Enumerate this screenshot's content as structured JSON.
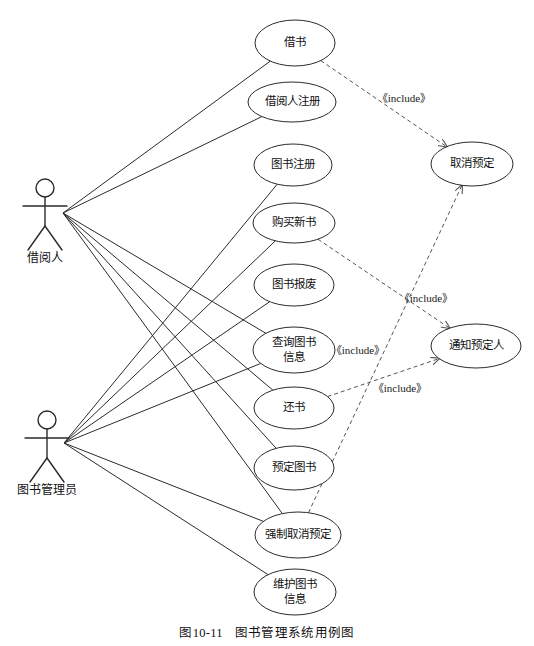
{
  "figure": {
    "caption_number": "图10-11",
    "caption_title": "图书管理系统用例图"
  },
  "actors": [
    {
      "id": "borrower",
      "label": "借阅人",
      "x": 45,
      "y": 188,
      "hub_x": 63,
      "hub_y": 213,
      "label_y": 262
    },
    {
      "id": "librarian",
      "label": "图书管理员",
      "x": 47,
      "y": 420,
      "hub_x": 64,
      "hub_y": 443,
      "label_y": 494
    }
  ],
  "use_cases": [
    {
      "id": "uc-borrow-book",
      "label": "借书",
      "label2": "",
      "cx": 295,
      "cy": 43,
      "rx": 40,
      "ry": 23
    },
    {
      "id": "uc-register-borrower",
      "label": "借阅人注册",
      "label2": "",
      "cx": 292,
      "cy": 102,
      "rx": 44,
      "ry": 20
    },
    {
      "id": "uc-register-book",
      "label": "图书注册",
      "label2": "",
      "cx": 293,
      "cy": 165,
      "rx": 39,
      "ry": 21
    },
    {
      "id": "uc-purchase-book",
      "label": "购买新书",
      "label2": "",
      "cx": 294,
      "cy": 223,
      "rx": 41,
      "ry": 20
    },
    {
      "id": "uc-scrap-book",
      "label": "图书报废",
      "label2": "",
      "cx": 294,
      "cy": 285,
      "rx": 40,
      "ry": 21
    },
    {
      "id": "uc-query-book-info",
      "label": "查询图书",
      "label2": "信息",
      "cx": 294,
      "cy": 350,
      "rx": 41,
      "ry": 23
    },
    {
      "id": "uc-return-book",
      "label": "还书",
      "label2": "",
      "cx": 294,
      "cy": 408,
      "rx": 40,
      "ry": 21
    },
    {
      "id": "uc-reserve-book",
      "label": "预定图书",
      "label2": "",
      "cx": 294,
      "cy": 468,
      "rx": 40,
      "ry": 22
    },
    {
      "id": "uc-force-cancel",
      "label": "强制取消预定",
      "label2": "",
      "cx": 298,
      "cy": 535,
      "rx": 43,
      "ry": 23
    },
    {
      "id": "uc-maintain-book-info",
      "label": "维护图书",
      "label2": "信息",
      "cx": 295,
      "cy": 592,
      "rx": 41,
      "ry": 23
    },
    {
      "id": "uc-cancel-reservation",
      "label": "取消预定",
      "label2": "",
      "cx": 472,
      "cy": 164,
      "rx": 41,
      "ry": 22
    },
    {
      "id": "uc-notify-reserver",
      "label": "通知预定人",
      "label2": "",
      "cx": 476,
      "cy": 346,
      "rx": 45,
      "ry": 22
    }
  ],
  "include_labels": [
    {
      "id": "include-1",
      "text": "《include》",
      "x": 404,
      "y": 102
    },
    {
      "id": "include-2",
      "text": "《include》",
      "x": 426,
      "y": 302
    },
    {
      "id": "include-3",
      "text": "《include》",
      "x": 358,
      "y": 354
    },
    {
      "id": "include-4",
      "text": "《include》",
      "x": 400,
      "y": 392
    }
  ],
  "associations": [
    {
      "from": "borrower",
      "to": "uc-borrow-book"
    },
    {
      "from": "borrower",
      "to": "uc-register-borrower"
    },
    {
      "from": "borrower",
      "to": "uc-query-book-info"
    },
    {
      "from": "borrower",
      "to": "uc-return-book"
    },
    {
      "from": "borrower",
      "to": "uc-reserve-book"
    },
    {
      "from": "borrower",
      "to": "uc-force-cancel"
    },
    {
      "from": "librarian",
      "to": "uc-register-book"
    },
    {
      "from": "librarian",
      "to": "uc-purchase-book"
    },
    {
      "from": "librarian",
      "to": "uc-scrap-book"
    },
    {
      "from": "librarian",
      "to": "uc-query-book-info"
    },
    {
      "from": "librarian",
      "to": "uc-force-cancel"
    },
    {
      "from": "librarian",
      "to": "uc-maintain-book-info"
    }
  ],
  "includes": [
    {
      "from": "uc-borrow-book",
      "to": "uc-cancel-reservation"
    },
    {
      "from": "uc-force-cancel",
      "to": "uc-cancel-reservation"
    },
    {
      "from": "uc-purchase-book",
      "to": "uc-notify-reserver"
    },
    {
      "from": "uc-return-book",
      "to": "uc-notify-reserver"
    }
  ],
  "colors": {
    "stroke": "#2b2b2b",
    "dashed_stroke": "#555555",
    "background": "#ffffff",
    "text": "#111111"
  }
}
